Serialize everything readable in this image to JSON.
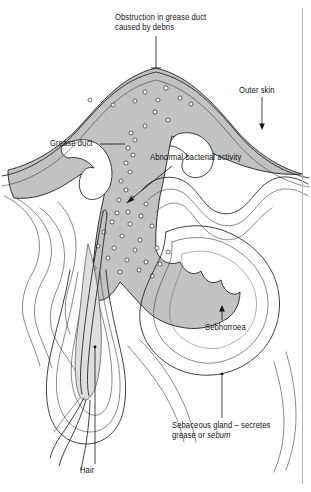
{
  "figure": {
    "type": "anatomical-cross-section",
    "background_color": "#ffffff",
    "outline_color": "#1a1a1a",
    "inflammation_fill_color": "#c2c2c2",
    "follicle_shading_color": "#dedede"
  },
  "labels": {
    "obstruction": {
      "text": "Obstruction in grease duct\ncaused by debris",
      "leader": "vertical-line-down-to-skin-surface"
    },
    "outer_skin": {
      "text": "Outer skin",
      "leader": "vertical-line-down-to-epidermis"
    },
    "grease_duct": {
      "text": "Grease duct",
      "leader": "horizontal-line-right-to-duct"
    },
    "abnormal_bacterial_activity": {
      "text": "Abnormal bacterial activity",
      "leader": "diagonal-arrow-down-left-into-pus"
    },
    "sebhorroea": {
      "text": "Sebhorroea",
      "leader": "vertical-arrow-up-to-gland"
    },
    "sebaceous_gland": {
      "text_line1": "Sebaceous gland – secretes",
      "text_line2_prefix": "grease or ",
      "text_line2_italic": "sebum",
      "leader": "vertical-line-up-to-gland-lobe"
    },
    "hair": {
      "text": "Hair",
      "leader": "vertical-line-up-to-hair-shaft"
    }
  },
  "structures": [
    {
      "name": "raised-inflamed-pustule",
      "fill": "#c2c2c2"
    },
    {
      "name": "epidermis-surface-line",
      "fill": "none"
    },
    {
      "name": "grease-duct-channel",
      "fill": "#c2c2c2"
    },
    {
      "name": "bacteria-dots",
      "count": 42,
      "fill": "#ffffff",
      "stroke": "#333333"
    },
    {
      "name": "sebaceous-gland-lobes",
      "fill": "#ffffff"
    },
    {
      "name": "hair-follicle",
      "fill": "#ffffff"
    },
    {
      "name": "hair-shaft",
      "fill": "#ffffff"
    },
    {
      "name": "hair-bulb-root",
      "fill": "#dedede"
    },
    {
      "name": "dermis-tissue-contour-lines",
      "fill": "none"
    }
  ]
}
